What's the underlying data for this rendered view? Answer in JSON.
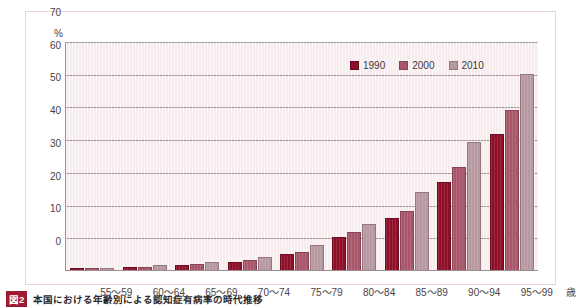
{
  "figure": {
    "caption_tag": "図2",
    "caption_text": "本国における年齢別による認知症有病率の時代推移"
  },
  "legend": {
    "position": "top-right",
    "items": [
      {
        "label": "1990",
        "color": "#8e1028",
        "icon": "legend-swatch"
      },
      {
        "label": "2000",
        "color": "#a8576a",
        "icon": "legend-swatch"
      },
      {
        "label": "2010",
        "color": "#b79aa1",
        "icon": "legend-swatch"
      }
    ]
  },
  "axes": {
    "y_unit": "%",
    "x_unit": "歳",
    "y_ticks": [
      "70",
      "60",
      "50",
      "40",
      "30",
      "20",
      "10",
      "0"
    ]
  },
  "chart_data": {
    "type": "bar",
    "title": "本国における年齢別による認知症有病率の時代推移",
    "xlabel": "歳",
    "ylabel": "%",
    "ylim": [
      0,
      70
    ],
    "ytick_step": 10,
    "grid": true,
    "legend_position": "top-right",
    "categories": [
      "55～59",
      "60～64",
      "65～69",
      "70～74",
      "75～79",
      "80～84",
      "85～89",
      "90～94",
      "95～99"
    ],
    "series": [
      {
        "name": "1990",
        "color": "#8e1028",
        "values": [
          0.5,
          0.9,
          1.5,
          2.5,
          5.0,
          10.0,
          16.0,
          27.0,
          41.5
        ]
      },
      {
        "name": "2000",
        "color": "#a8576a",
        "values": [
          0.6,
          1.0,
          1.8,
          3.0,
          5.5,
          11.5,
          18.0,
          31.5,
          49.0
        ]
      },
      {
        "name": "2010",
        "color": "#b79aa1",
        "values": [
          0.7,
          1.4,
          2.3,
          4.0,
          7.5,
          14.0,
          24.0,
          39.0,
          60.0
        ]
      }
    ]
  }
}
